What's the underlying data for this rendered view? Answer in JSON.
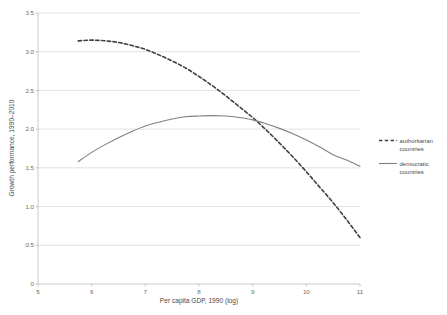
{
  "chart_data": {
    "type": "line",
    "title": "",
    "xlabel": "Per capita GDP, 1990 (log)",
    "ylabel": "Growth performance, 1990–2010",
    "xlim": [
      5,
      11
    ],
    "ylim": [
      0,
      3.5
    ],
    "xticks": [
      "5",
      "6",
      "7",
      "8",
      "9",
      "10",
      "11"
    ],
    "xtick_values": [
      5,
      6,
      7,
      8,
      9,
      10,
      11
    ],
    "yticks": [
      "0",
      "0.5",
      "1.0",
      "1.5",
      "2.0",
      "2.5",
      "3.0",
      "3.5"
    ],
    "ytick_values": [
      0,
      0.5,
      1.0,
      1.5,
      2.0,
      2.5,
      3.0,
      3.5
    ],
    "grid": "horizontal",
    "legend_position": "right",
    "series": [
      {
        "name": "authoritarian countries",
        "style": "dashed",
        "color": "#404040",
        "x": [
          5.75,
          6.0,
          6.25,
          6.5,
          6.75,
          7.0,
          7.25,
          7.5,
          7.75,
          8.0,
          8.25,
          8.5,
          8.75,
          9.0,
          9.25,
          9.5,
          9.75,
          10.0,
          10.25,
          10.5,
          10.75,
          11.0
        ],
        "values": [
          3.14,
          3.15,
          3.14,
          3.12,
          3.08,
          3.03,
          2.96,
          2.88,
          2.79,
          2.68,
          2.56,
          2.43,
          2.29,
          2.15,
          1.99,
          1.82,
          1.64,
          1.45,
          1.25,
          1.05,
          0.83,
          0.6
        ]
      },
      {
        "name": "democratic countries",
        "style": "solid",
        "color": "#808080",
        "x": [
          5.75,
          6.0,
          6.25,
          6.5,
          6.75,
          7.0,
          7.25,
          7.5,
          7.75,
          8.0,
          8.25,
          8.5,
          8.75,
          9.0,
          9.25,
          9.5,
          9.75,
          10.0,
          10.25,
          10.5,
          10.75,
          11.0
        ],
        "values": [
          1.58,
          1.7,
          1.8,
          1.89,
          1.97,
          2.04,
          2.09,
          2.13,
          2.16,
          2.17,
          2.175,
          2.17,
          2.15,
          2.12,
          2.07,
          2.01,
          1.94,
          1.86,
          1.77,
          1.67,
          1.6,
          1.52
        ]
      }
    ]
  },
  "legend": {
    "items": [
      {
        "label_line1": "authoritarian",
        "label_line2": "countries",
        "style": "dashed",
        "color": "#404040"
      },
      {
        "label_line1": "democratic",
        "label_line2": "countries",
        "style": "solid",
        "color": "#808080"
      }
    ]
  },
  "colors": {
    "authoritarian": "#404040",
    "democratic": "#808080",
    "grid": "#d4d4d4",
    "axis": "#bcbcbc",
    "text": "#595959",
    "background": "#ffffff"
  }
}
